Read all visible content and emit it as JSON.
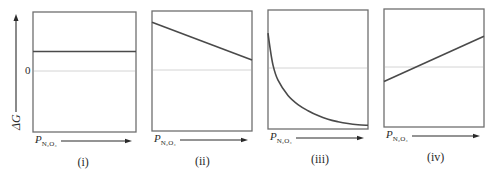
{
  "figure": {
    "ylabel": "ΔG",
    "zero_tick": "0",
    "xlabel_base": "P",
    "xlabel_sub": "N₂O₄"
  },
  "panels": [
    {
      "id": "i",
      "label": "(i)",
      "frame": [
        33,
        12,
        136,
        132
      ],
      "zero_y": 71,
      "shape": "constant-positive"
    },
    {
      "id": "ii",
      "label": "(ii)",
      "frame": [
        152,
        11,
        252,
        131
      ],
      "zero_y": 70,
      "shape": "decreasing-linear-positive"
    },
    {
      "id": "iii",
      "label": "(iii)",
      "frame": [
        268,
        10,
        368,
        129
      ],
      "zero_y": 68,
      "shape": "decreasing-convex-crosses-zero"
    },
    {
      "id": "iv",
      "label": "(iv)",
      "frame": [
        384,
        9,
        484,
        127
      ],
      "zero_y": 67,
      "shape": "increasing-linear-crosses-zero"
    }
  ],
  "chart_data": {
    "type": "line",
    "title": "",
    "xlabel": "P_N2O4",
    "ylabel": "ΔG",
    "grid": false,
    "legend": null,
    "reference_line": {
      "y": 0,
      "label": "0"
    },
    "ylim": [
      -1,
      1
    ],
    "xlim": [
      0,
      1
    ],
    "panels": [
      {
        "label": "(i)",
        "series": [
          {
            "name": "ΔG",
            "x": [
              0,
              1
            ],
            "y": [
              0.33,
              0.33
            ]
          }
        ]
      },
      {
        "label": "(ii)",
        "series": [
          {
            "name": "ΔG",
            "x": [
              0,
              1
            ],
            "y": [
              0.81,
              0.17
            ]
          }
        ]
      },
      {
        "label": "(iii)",
        "series": [
          {
            "name": "ΔG",
            "x": [
              0,
              0.02,
              0.05,
              0.1,
              0.2,
              0.3,
              0.4,
              0.5,
              0.6,
              0.7,
              0.8,
              0.9,
              1.0
            ],
            "y": [
              0.6,
              0.35,
              0.05,
              -0.2,
              -0.45,
              -0.6,
              -0.7,
              -0.78,
              -0.84,
              -0.88,
              -0.91,
              -0.93,
              -0.94
            ]
          }
        ]
      },
      {
        "label": "(iv)",
        "series": [
          {
            "name": "ΔG",
            "x": [
              0,
              1
            ],
            "y": [
              -0.24,
              0.53
            ]
          }
        ]
      }
    ]
  }
}
